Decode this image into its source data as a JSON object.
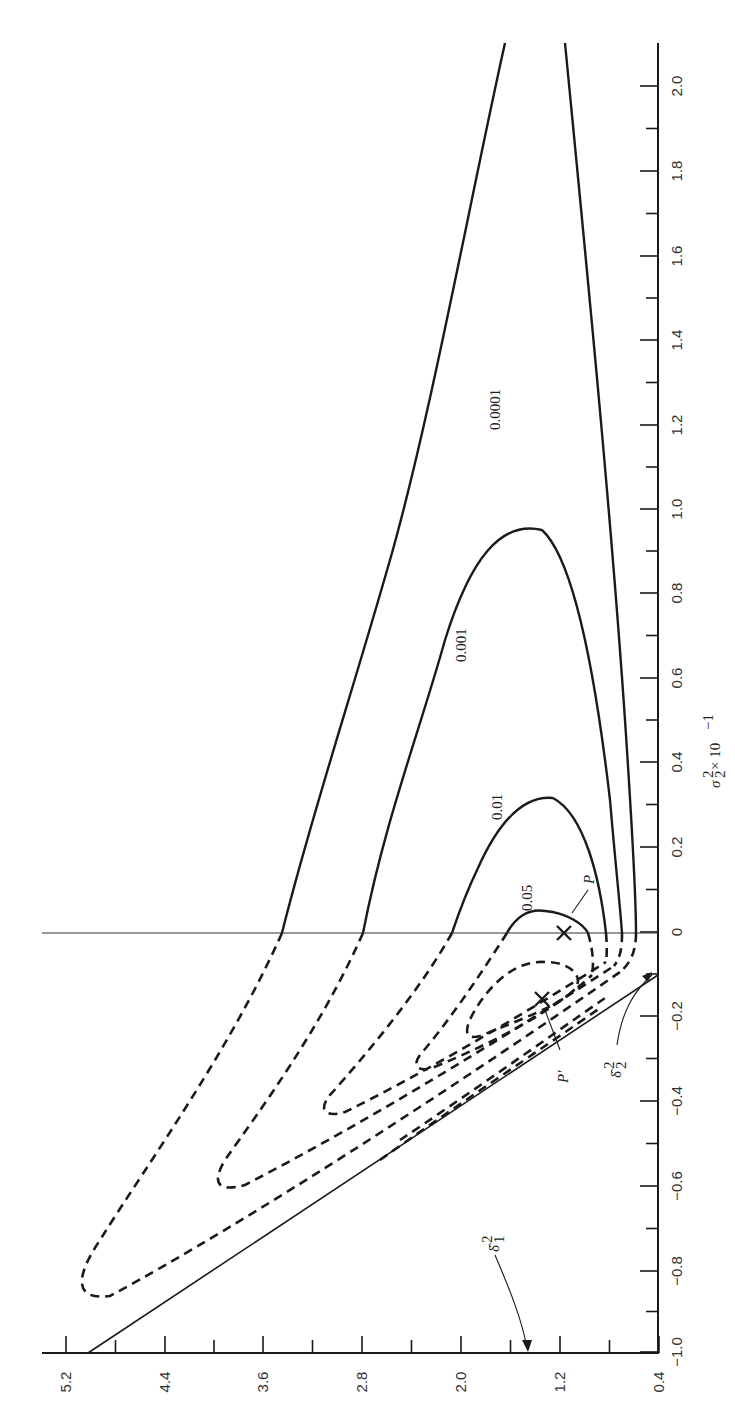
{
  "chart_data": {
    "type": "line",
    "orientation": "rotated 90 degrees (printed sideways)",
    "title": "",
    "xlabel": "σ₂² × 10⁻¹",
    "ylabel": "",
    "x_axis": {
      "label": "σ₂² × 10⁻¹",
      "ticks": [
        "-1.0",
        "-0.8",
        "-0.6",
        "-0.4",
        "-0.2",
        "0",
        "0.2",
        "0.4",
        "0.6",
        "0.8",
        "1.0",
        "1.2",
        "1.4",
        "1.6",
        "1.8",
        "2.0"
      ],
      "range": [
        -1.0,
        2.1
      ]
    },
    "y_axis": {
      "label": "",
      "ticks": [
        "5.2",
        "4.4",
        "3.6",
        "2.8",
        "2.0",
        "1.2",
        "0.4"
      ],
      "range": [
        0.4,
        5.6
      ]
    },
    "grid": false,
    "reference_lines": [
      {
        "name": "σ₂² = 0",
        "value": 0
      },
      {
        "name": "boundary line from δ̂₁² to δ̂₂²"
      }
    ],
    "contour_levels": [
      {
        "label": "0.0001",
        "style": "solid (σ₂²>0) / dashed (σ₂²<0)"
      },
      {
        "label": "0.001",
        "style": "solid (σ₂²>0) / dashed (σ₂²<0)"
      },
      {
        "label": "0.01",
        "style": "solid (σ₂²>0) / dashed (σ₂²<0)"
      },
      {
        "label": "0.05",
        "style": "solid (σ₂²>0) / dashed (σ₂²<0)"
      }
    ],
    "series": [
      {
        "name": "0.0001",
        "apex_x": 2.1,
        "left_crossing_at_zero_y": 3.6,
        "tip": {
          "x": -0.9,
          "y": 5.0
        }
      },
      {
        "name": "0.001",
        "apex_x": 0.97,
        "left_crossing_at_zero_y": 2.8,
        "tip": {
          "x": -0.65,
          "y": 3.9
        }
      },
      {
        "name": "0.01",
        "apex_x": 0.32,
        "left_crossing_at_zero_y": 2.0,
        "tip": {
          "x": -0.45,
          "y": 2.75
        }
      },
      {
        "name": "0.05",
        "apex_x": 0.05,
        "left_crossing_at_zero_y": 1.45,
        "tip": {
          "x": -0.33,
          "y": 1.9
        }
      }
    ],
    "points": [
      {
        "label": "P",
        "x": 0.0,
        "y": 1.2,
        "marker": "×"
      },
      {
        "label": "P'",
        "x": -0.15,
        "y": 1.6,
        "marker": "×"
      }
    ],
    "annotations": [
      "δ̂₁²",
      "δ̂₂²",
      "P",
      "P'"
    ]
  },
  "labels": {
    "c0001": "0.0001",
    "c001": "0.001",
    "c01": "0.01",
    "c05": "0.05",
    "P": "P",
    "Pprime": "P′",
    "delta1": "δ̂",
    "delta1_sup": "2",
    "delta1_sub": "1",
    "delta2": "δ̂",
    "delta2_sup": "2",
    "delta2_sub": "2",
    "xaxis_main": "σ",
    "xaxis_sup": "2",
    "xaxis_sub": "2",
    "xaxis_tail": " × 10",
    "xaxis_exp": "−1"
  },
  "ticks_right": [
    {
      "label": "2.0",
      "y": 86
    },
    {
      "label": "1.8",
      "y": 171
    },
    {
      "label": "1.6",
      "y": 256
    },
    {
      "label": "1.4",
      "y": 340
    },
    {
      "label": "1.2",
      "y": 425
    },
    {
      "label": "1.0",
      "y": 509
    },
    {
      "label": "0.8",
      "y": 593
    },
    {
      "label": "0.6",
      "y": 678
    },
    {
      "label": "0.4",
      "y": 762
    },
    {
      "label": "0.2",
      "y": 847
    },
    {
      "label": "0",
      "y": 932
    },
    {
      "label": "−0.2",
      "y": 1016
    },
    {
      "label": "−0.4",
      "y": 1101
    },
    {
      "label": "−0.6",
      "y": 1186
    },
    {
      "label": "−0.8",
      "y": 1271
    },
    {
      "label": "−1.0",
      "y": 1352
    }
  ],
  "ticks_bottom": [
    {
      "label": "5.2",
      "x": 66
    },
    {
      "label": "4.4",
      "x": 165
    },
    {
      "label": "3.6",
      "x": 263
    },
    {
      "label": "2.8",
      "x": 362
    },
    {
      "label": "2.0",
      "x": 461
    },
    {
      "label": "1.2",
      "x": 560
    },
    {
      "label": "0.4",
      "x": 659
    }
  ]
}
